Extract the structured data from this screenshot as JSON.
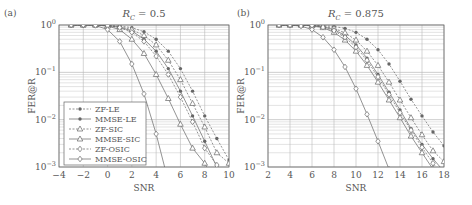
{
  "chart_data": [
    {
      "type": "line",
      "panel_label": "(a)",
      "title": "R_C = 0.5",
      "xlabel": "SNR",
      "ylabel": "FER@R",
      "xlim": [
        -4,
        10
      ],
      "ylim": [
        0.001,
        1
      ],
      "yscale": "log",
      "xticks": [
        -4,
        -2,
        0,
        2,
        4,
        6,
        8,
        10
      ],
      "yticks": [
        "10^0",
        "10^-1",
        "10^-2",
        "10^-3"
      ],
      "grid": true,
      "legend_position": "lower left",
      "series": [
        {
          "name": "ZF-LE",
          "style": "dashed",
          "marker": "dot",
          "x": [
            -3,
            -2,
            -1,
            0,
            1,
            2,
            3,
            4,
            5,
            6,
            7,
            8,
            9,
            10
          ],
          "y": [
            1,
            1,
            1,
            0.98,
            0.95,
            0.88,
            0.72,
            0.5,
            0.28,
            0.12,
            0.04,
            0.012,
            0.004,
            0.0014
          ]
        },
        {
          "name": "MMSE-LE",
          "style": "solid",
          "marker": "dot",
          "x": [
            -3,
            -2,
            -1,
            0,
            1,
            2,
            3,
            4,
            5,
            6,
            7,
            8,
            9,
            10
          ],
          "y": [
            1,
            1,
            1,
            0.97,
            0.9,
            0.75,
            0.5,
            0.28,
            0.12,
            0.04,
            0.012,
            0.0035,
            0.001,
            0.0003
          ]
        },
        {
          "name": "ZF-SIC",
          "style": "dashed",
          "marker": "triangle",
          "x": [
            -3,
            -2,
            -1,
            0,
            1,
            2,
            3,
            4,
            5,
            6,
            7,
            8,
            9,
            10
          ],
          "y": [
            1,
            1,
            1,
            0.97,
            0.92,
            0.8,
            0.6,
            0.38,
            0.18,
            0.07,
            0.022,
            0.007,
            0.002,
            0.0012
          ]
        },
        {
          "name": "MMSE-SIC",
          "style": "solid",
          "marker": "triangle",
          "x": [
            -3,
            -2,
            -1,
            0,
            1,
            2,
            3,
            4,
            5,
            6,
            7,
            8,
            9
          ],
          "y": [
            1,
            1,
            1,
            0.95,
            0.8,
            0.5,
            0.25,
            0.09,
            0.028,
            0.008,
            0.0025,
            0.0012,
            0.0004
          ]
        },
        {
          "name": "ZF-OSIC",
          "style": "dashed",
          "marker": "diamond",
          "x": [
            -3,
            -2,
            -1,
            0,
            1,
            2,
            3,
            4,
            5,
            6,
            7,
            8,
            9
          ],
          "y": [
            1,
            1,
            1,
            0.96,
            0.88,
            0.7,
            0.45,
            0.22,
            0.09,
            0.03,
            0.009,
            0.0025,
            0.0011
          ]
        },
        {
          "name": "MMSE-OSIC",
          "style": "solid",
          "marker": "diamond",
          "x": [
            -3,
            -2,
            -1,
            0,
            1,
            2,
            3,
            4,
            5
          ],
          "y": [
            1,
            1,
            0.98,
            0.8,
            0.45,
            0.15,
            0.035,
            0.005,
            0.0005
          ]
        }
      ]
    },
    {
      "type": "line",
      "panel_label": "(b)",
      "title": "R_C = 0.875",
      "xlabel": "SNR",
      "ylabel": "FER@R",
      "xlim": [
        2,
        18
      ],
      "ylim": [
        0.001,
        1
      ],
      "yscale": "log",
      "xticks": [
        2,
        4,
        6,
        8,
        10,
        12,
        14,
        16,
        18
      ],
      "yticks": [
        "10^0",
        "10^-1",
        "10^-2",
        "10^-3"
      ],
      "grid": true,
      "series": [
        {
          "name": "ZF-LE",
          "style": "dashed",
          "marker": "dot",
          "x": [
            3,
            4,
            5,
            6,
            7,
            8,
            9,
            10,
            11,
            12,
            13,
            14,
            15,
            16,
            17,
            18
          ],
          "y": [
            1,
            1,
            1,
            0.99,
            0.97,
            0.93,
            0.85,
            0.7,
            0.5,
            0.3,
            0.15,
            0.065,
            0.027,
            0.012,
            0.0055,
            0.0028
          ]
        },
        {
          "name": "MMSE-LE",
          "style": "solid",
          "marker": "dot",
          "x": [
            3,
            4,
            5,
            6,
            7,
            8,
            9,
            10,
            11,
            12,
            13,
            14,
            15,
            16,
            17,
            18
          ],
          "y": [
            1,
            1,
            1,
            0.98,
            0.92,
            0.8,
            0.6,
            0.38,
            0.2,
            0.09,
            0.038,
            0.016,
            0.0065,
            0.003,
            0.0015,
            0.0008
          ]
        },
        {
          "name": "ZF-SIC",
          "style": "dashed",
          "marker": "triangle",
          "x": [
            3,
            4,
            5,
            6,
            7,
            8,
            9,
            10,
            11,
            12,
            13,
            14,
            15,
            16,
            17,
            18
          ],
          "y": [
            1,
            1,
            1,
            0.98,
            0.94,
            0.85,
            0.68,
            0.48,
            0.28,
            0.14,
            0.062,
            0.026,
            0.011,
            0.0048,
            0.0022,
            0.0013
          ]
        },
        {
          "name": "MMSE-SIC",
          "style": "solid",
          "marker": "triangle",
          "x": [
            3,
            4,
            5,
            6,
            7,
            8,
            9,
            10,
            11,
            12,
            13,
            14,
            15,
            16,
            17
          ],
          "y": [
            1,
            1,
            1,
            0.96,
            0.88,
            0.7,
            0.48,
            0.28,
            0.14,
            0.062,
            0.026,
            0.011,
            0.0045,
            0.002,
            0.0009
          ]
        },
        {
          "name": "ZF-OSIC",
          "style": "dashed",
          "marker": "diamond",
          "x": [
            3,
            4,
            5,
            6,
            7,
            8,
            9,
            10,
            11,
            12,
            13,
            14,
            15,
            16,
            17,
            18
          ],
          "y": [
            1,
            1,
            1,
            0.97,
            0.9,
            0.76,
            0.55,
            0.34,
            0.18,
            0.08,
            0.034,
            0.014,
            0.006,
            0.0026,
            0.0012,
            0.0006
          ]
        },
        {
          "name": "MMSE-OSIC",
          "style": "solid",
          "marker": "diamond",
          "x": [
            3,
            4,
            5,
            6,
            7,
            8,
            9,
            10,
            11,
            12,
            13
          ],
          "y": [
            1,
            1,
            0.95,
            0.8,
            0.55,
            0.3,
            0.13,
            0.045,
            0.013,
            0.0035,
            0.0009
          ]
        }
      ]
    }
  ]
}
